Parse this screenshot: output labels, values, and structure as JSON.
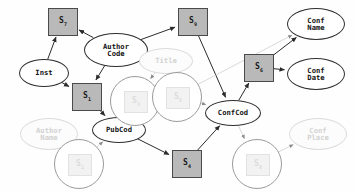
{
  "diagram": {
    "colors": {
      "square_fill": "#b9b9b9",
      "square_border": "#4a4a4a",
      "ellipse_border": "#2e2e2e",
      "edge_solid": "#2b2b2b",
      "edge_faded": "#cfcfcf",
      "ghost_text": "#d2d2d2",
      "background": "#fefefe"
    },
    "nodes": [
      {
        "id": "s7",
        "label": "S",
        "sub": "7",
        "shape": "square",
        "state": "solid",
        "x": 48,
        "y": 8,
        "w": 28,
        "h": 26
      },
      {
        "id": "s9",
        "label": "S",
        "sub": "9",
        "shape": "square",
        "state": "solid",
        "x": 178,
        "y": 8,
        "w": 28,
        "h": 26
      },
      {
        "id": "s1",
        "label": "S",
        "sub": "1",
        "shape": "square",
        "state": "solid",
        "x": 72,
        "y": 83,
        "w": 28,
        "h": 26
      },
      {
        "id": "s6",
        "label": "S",
        "sub": "6",
        "shape": "square",
        "state": "solid",
        "x": 244,
        "y": 54,
        "w": 28,
        "h": 26
      },
      {
        "id": "s4",
        "label": "S",
        "sub": "4",
        "shape": "square",
        "state": "solid",
        "x": 172,
        "y": 150,
        "w": 28,
        "h": 26
      },
      {
        "id": "authorcode",
        "label": "Author\nCode",
        "shape": "ellipse",
        "state": "solid",
        "x": 84,
        "y": 33,
        "w": 62,
        "h": 32
      },
      {
        "id": "inst",
        "label": "Inst",
        "shape": "ellipse",
        "state": "solid",
        "x": 19,
        "y": 59,
        "w": 48,
        "h": 26
      },
      {
        "id": "pubcod",
        "label": "PubCod",
        "shape": "ellipse",
        "state": "solid",
        "x": 92,
        "y": 117,
        "w": 52,
        "h": 24
      },
      {
        "id": "confcod",
        "label": "ConfCod",
        "shape": "ellipse",
        "state": "solid",
        "x": 205,
        "y": 100,
        "w": 54,
        "h": 24
      },
      {
        "id": "confname",
        "label": "Conf\nName",
        "shape": "ellipse",
        "state": "solid",
        "x": 287,
        "y": 8,
        "w": 56,
        "h": 30
      },
      {
        "id": "confdate",
        "label": "Conf\nDate",
        "shape": "ellipse",
        "state": "solid",
        "x": 287,
        "y": 58,
        "w": 56,
        "h": 30
      },
      {
        "id": "title",
        "label": "Title",
        "shape": "ellipse",
        "state": "faded",
        "x": 139,
        "y": 48,
        "w": 52,
        "h": 24
      },
      {
        "id": "authorname",
        "label": "Author\nName",
        "shape": "ellipse",
        "state": "faded",
        "x": 20,
        "y": 118,
        "w": 56,
        "h": 30
      },
      {
        "id": "confplace",
        "label": "Conf\nPlace",
        "shape": "ellipse",
        "state": "faded",
        "x": 289,
        "y": 118,
        "w": 56,
        "h": 30
      },
      {
        "id": "c_s3",
        "label": "S",
        "sub": "3",
        "shape": "circle",
        "state": "faded",
        "x": 110,
        "y": 76,
        "w": 48,
        "h": 48
      },
      {
        "id": "c_s5",
        "label": "S",
        "sub": "5",
        "shape": "circle",
        "state": "faded",
        "x": 152,
        "y": 72,
        "w": 48,
        "h": 48
      },
      {
        "id": "c_s2",
        "label": "S",
        "sub": "2",
        "shape": "circle",
        "state": "faded",
        "x": 54,
        "y": 139,
        "w": 48,
        "h": 48
      },
      {
        "id": "c_s8",
        "label": "S",
        "sub": "8",
        "shape": "circle",
        "state": "faded",
        "x": 232,
        "y": 139,
        "w": 48,
        "h": 48
      }
    ],
    "edges": [
      {
        "from": "inst",
        "to": "s7",
        "style": "solid"
      },
      {
        "from": "authorcode",
        "to": "s7",
        "style": "solid"
      },
      {
        "from": "authorcode",
        "to": "s9",
        "style": "solid"
      },
      {
        "from": "authorcode",
        "to": "s1",
        "style": "solid"
      },
      {
        "from": "inst",
        "to": "s1",
        "style": "solid"
      },
      {
        "from": "s1",
        "to": "pubcod",
        "style": "solid"
      },
      {
        "from": "pubcod",
        "to": "s4",
        "style": "solid"
      },
      {
        "from": "s4",
        "to": "confcod",
        "style": "solid"
      },
      {
        "from": "s9",
        "to": "confcod",
        "style": "solid"
      },
      {
        "from": "confcod",
        "to": "s6",
        "style": "solid"
      },
      {
        "from": "s6",
        "to": "confname",
        "style": "solid"
      },
      {
        "from": "s6",
        "to": "confdate",
        "style": "solid"
      },
      {
        "from": "title",
        "to": "c_s3",
        "style": "faded"
      },
      {
        "from": "title",
        "to": "c_s5",
        "style": "faded"
      },
      {
        "from": "c_s3",
        "to": "c_s5",
        "style": "faded"
      },
      {
        "from": "c_s3",
        "to": "pubcod",
        "style": "faded"
      },
      {
        "from": "c_s5",
        "to": "confcod",
        "style": "faded"
      },
      {
        "from": "authorname",
        "to": "c_s2",
        "style": "faded"
      },
      {
        "from": "c_s2",
        "to": "pubcod",
        "style": "faded"
      },
      {
        "from": "confcod",
        "to": "c_s8",
        "style": "faded"
      },
      {
        "from": "c_s8",
        "to": "confplace",
        "style": "faded"
      },
      {
        "from": "c_s5",
        "to": "confname",
        "style": "faded"
      }
    ]
  }
}
